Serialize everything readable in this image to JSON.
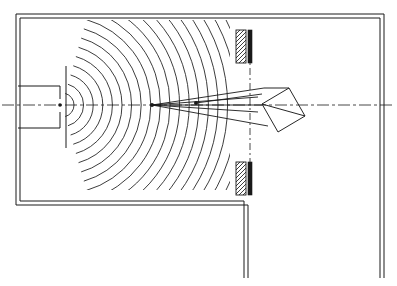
{
  "figure": {
    "type": "technical-line-drawing",
    "title": "",
    "background_color": "#ffffff",
    "line_color": "#1a1a1a",
    "canvas": {
      "width": 397,
      "height": 286
    }
  },
  "chamber": {
    "name": "enclosure-outline",
    "outer": {
      "x": 16,
      "y": 14,
      "width": 368,
      "height": 191
    },
    "inner_offset": 4,
    "stroke_width": 1.0,
    "bottom_wall_end_x": 248,
    "right_wall_extends_to_y": 278,
    "drop_wall_x": 248,
    "drop_wall_bottom_y": 278
  },
  "feed": {
    "name": "waveguide-feed",
    "label": "",
    "x": 18,
    "y_top": 86,
    "y_bottom": 128,
    "width": 44,
    "throat_x": 60,
    "mouth_x": 66,
    "gap_top_y": 99,
    "gap_bottom_y": 112
  },
  "axis": {
    "name": "optical-axis",
    "y": 105,
    "x_start": 2,
    "x_end": 394,
    "dash_pattern": "12 3 3 3",
    "stroke_width": 0.8
  },
  "vertical_axis": {
    "name": "aperture-axis",
    "x": 250,
    "y_start": 38,
    "y_end": 190,
    "dash_pattern": "7 3 2 3",
    "stroke_width": 0.8
  },
  "wavefronts": {
    "name": "wavefront-arcs",
    "count": 19,
    "description": "concentric circular wavefront arcs radiating from the feed mouth",
    "center_x": 62,
    "center_y": 105,
    "first_radius": 12,
    "radius_step": 9.6,
    "angular_half_span_deg": 74,
    "stroke_width": 0.85,
    "clip": {
      "x": 20,
      "y": 20,
      "width": 210,
      "height": 170
    }
  },
  "focus": {
    "name": "focal-points",
    "primary": {
      "x": 152,
      "y": 105,
      "r": 2.0
    },
    "secondary": {
      "x": 196,
      "y": 103,
      "r": 2.0
    },
    "tertiary": {
      "x": 60,
      "y": 105,
      "r": 1.8
    }
  },
  "rays": {
    "name": "ray-bundle",
    "stroke_width": 0.9,
    "segments": [
      {
        "id": "ray-upper-outer",
        "x1": 152,
        "y1": 105,
        "x2": 264,
        "y2": 88
      },
      {
        "id": "ray-upper-inner",
        "x1": 152,
        "y1": 105,
        "x2": 258,
        "y2": 97
      },
      {
        "id": "ray-lower-inner",
        "x1": 152,
        "y1": 105,
        "x2": 258,
        "y2": 112
      },
      {
        "id": "ray-lower-outer",
        "x1": 152,
        "y1": 105,
        "x2": 268,
        "y2": 126
      },
      {
        "id": "ray-axial",
        "x1": 152,
        "y1": 105,
        "x2": 262,
        "y2": 105
      },
      {
        "id": "ray-from-secondary-up",
        "x1": 196,
        "y1": 103,
        "x2": 262,
        "y2": 94
      }
    ]
  },
  "apertures": [
    {
      "name": "aperture-block-upper",
      "hatch_plate": {
        "x": 236,
        "y": 30,
        "width": 10,
        "height": 33
      },
      "solid_bar": {
        "x": 248,
        "y": 30,
        "width": 4,
        "height": 33
      },
      "hatch_spacing": 4,
      "hatch_angle_deg": 45
    },
    {
      "name": "aperture-block-lower",
      "hatch_plate": {
        "x": 236,
        "y": 162,
        "width": 10,
        "height": 33
      },
      "solid_bar": {
        "x": 248,
        "y": 162,
        "width": 4,
        "height": 33
      },
      "hatch_spacing": 4,
      "hatch_angle_deg": 45
    }
  ],
  "prism": {
    "name": "prism-element",
    "description": "rotated rectangular prism shown as a diamond on the optical axis",
    "stroke_width": 0.95,
    "vertices": [
      {
        "x": 262,
        "y": 104
      },
      {
        "x": 289,
        "y": 88
      },
      {
        "x": 305,
        "y": 116
      },
      {
        "x": 278,
        "y": 132
      }
    ],
    "apex_right": {
      "x": 303,
      "y": 115
    },
    "edge_lines": [
      {
        "x1": 262,
        "y1": 104,
        "x2": 289,
        "y2": 88
      },
      {
        "x1": 289,
        "y1": 88,
        "x2": 305,
        "y2": 116
      },
      {
        "x1": 305,
        "y1": 116,
        "x2": 278,
        "y2": 132
      },
      {
        "x1": 278,
        "y1": 132,
        "x2": 262,
        "y2": 104
      }
    ],
    "internal_lines": [
      {
        "x1": 262,
        "y1": 104,
        "x2": 305,
        "y2": 116
      },
      {
        "x1": 264,
        "y1": 88,
        "x2": 289,
        "y2": 88
      }
    ]
  },
  "annotations": []
}
